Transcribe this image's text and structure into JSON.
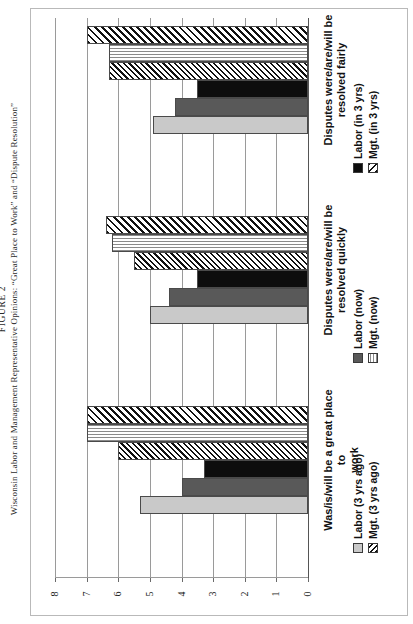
{
  "figure": {
    "number": "FIGURE 2",
    "caption": "Wisconsin Labor and Management Representative Opinions: “Great Place to Work” and “Dispute Resolution”"
  },
  "axis": {
    "ticks": [
      "8",
      "7",
      "6",
      "5",
      "4",
      "3",
      "2",
      "1",
      "0"
    ],
    "min": 0,
    "max": 8
  },
  "categories": [
    {
      "id": "resolved-fairly",
      "label": "Disputes were/are/will be\nresolved fairly"
    },
    {
      "id": "resolved-quickly",
      "label": "Disputes were/are/will be\nresolved quickly"
    },
    {
      "id": "great-place",
      "label": "Was/is/will be a great place to\nwork"
    }
  ],
  "legends": [
    {
      "group": "resolved-fairly",
      "items": [
        {
          "label": "Labor (in 3 yrs)",
          "swatch": "black"
        },
        {
          "label": "Mgt. (in 3 yrs)",
          "swatch": "diagonal-hatch"
        }
      ]
    },
    {
      "group": "resolved-quickly",
      "items": [
        {
          "label": "Labor (now)",
          "swatch": "dark-gray"
        },
        {
          "label": "Mgt. (now)",
          "swatch": "horizontal-hatch"
        }
      ]
    },
    {
      "group": "great-place",
      "items": [
        {
          "label": "Labor (3 yrs ago)",
          "swatch": "light-gray"
        },
        {
          "label": "Mgt. (3 yrs ago)",
          "swatch": "diagonal-hatch"
        }
      ]
    }
  ],
  "chart_data": {
    "type": "bar",
    "orientation": "horizontal",
    "title": "Wisconsin Labor and Management Representative Opinions: “Great Place to Work” and “Dispute Resolution”",
    "xlabel": "",
    "ylabel": "",
    "xlim": [
      0,
      8
    ],
    "grid": true,
    "legend_position": "right",
    "categories": [
      "Disputes were/are/will be resolved fairly",
      "Disputes were/are/will be resolved quickly",
      "Was/is/will be a great place to work"
    ],
    "series": [
      {
        "name": "Mgt. (in 3 yrs)",
        "fill": "diagonal-hatch",
        "values": [
          7.0,
          6.4,
          7.0
        ]
      },
      {
        "name": "Mgt. (now)",
        "fill": "horizontal-hatch",
        "values": [
          6.3,
          6.2,
          7.0
        ]
      },
      {
        "name": "Mgt. (3 yrs ago)",
        "fill": "diagonal-hatch",
        "values": [
          6.3,
          5.5,
          6.0
        ]
      },
      {
        "name": "Labor (in 3 yrs)",
        "fill": "black",
        "values": [
          3.5,
          3.5,
          3.3
        ]
      },
      {
        "name": "Labor (now)",
        "fill": "dark-gray",
        "values": [
          4.2,
          4.4,
          4.0
        ]
      },
      {
        "name": "Labor (3 yrs ago)",
        "fill": "light-gray",
        "values": [
          4.9,
          5.0,
          5.3
        ]
      }
    ],
    "bars": [
      {
        "group": "Disputes were/are/will be resolved fairly",
        "series": "Mgt. (in 3 yrs)",
        "value": 7.0
      },
      {
        "group": "Disputes were/are/will be resolved fairly",
        "series": "Mgt. (now)",
        "value": 6.3
      },
      {
        "group": "Disputes were/are/will be resolved fairly",
        "series": "Mgt. (3 yrs ago)",
        "value": 6.3
      },
      {
        "group": "Disputes were/are/will be resolved fairly",
        "series": "Labor (in 3 yrs)",
        "value": 3.5
      },
      {
        "group": "Disputes were/are/will be resolved fairly",
        "series": "Labor (now)",
        "value": 4.2
      },
      {
        "group": "Disputes were/are/will be resolved fairly",
        "series": "Labor (3 yrs ago)",
        "value": 4.9
      },
      {
        "group": "Disputes were/are/will be resolved quickly",
        "series": "Mgt. (in 3 yrs)",
        "value": 6.4
      },
      {
        "group": "Disputes were/are/will be resolved quickly",
        "series": "Mgt. (now)",
        "value": 6.2
      },
      {
        "group": "Disputes were/are/will be resolved quickly",
        "series": "Mgt. (3 yrs ago)",
        "value": 5.5
      },
      {
        "group": "Disputes were/are/will be resolved quickly",
        "series": "Labor (in 3 yrs)",
        "value": 3.5
      },
      {
        "group": "Disputes were/are/will be resolved quickly",
        "series": "Labor (now)",
        "value": 4.4
      },
      {
        "group": "Disputes were/are/will be resolved quickly",
        "series": "Labor (3 yrs ago)",
        "value": 5.0
      },
      {
        "group": "Was/is/will be a great place to work",
        "series": "Mgt. (in 3 yrs)",
        "value": 7.0
      },
      {
        "group": "Was/is/will be a great place to work",
        "series": "Mgt. (now)",
        "value": 7.0
      },
      {
        "group": "Was/is/will be a great place to work",
        "series": "Mgt. (3 yrs ago)",
        "value": 6.0
      },
      {
        "group": "Was/is/will be a great place to work",
        "series": "Labor (in 3 yrs)",
        "value": 3.3
      },
      {
        "group": "Was/is/will be a great place to work",
        "series": "Labor (now)",
        "value": 4.0
      },
      {
        "group": "Was/is/will be a great place to work",
        "series": "Labor (3 yrs ago)",
        "value": 5.3
      }
    ]
  }
}
